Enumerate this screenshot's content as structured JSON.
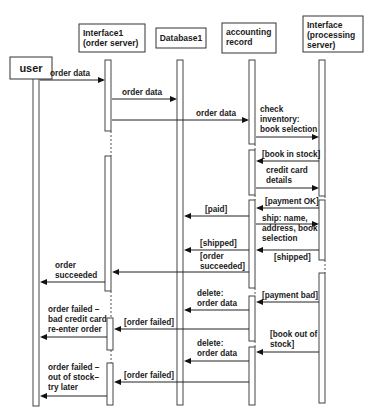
{
  "diagram": {
    "type": "sequence",
    "participants": [
      {
        "id": "user",
        "lines": [
          "user"
        ],
        "box": [
          10,
          57,
          42,
          22
        ],
        "fontSize": 11,
        "cx": 36
      },
      {
        "id": "interface1",
        "lines": [
          "Interface1",
          "(order server)"
        ],
        "box": [
          79,
          24,
          66,
          28
        ],
        "fontSize": 8.5,
        "cx": 110
      },
      {
        "id": "database1",
        "lines": [
          "Database1"
        ],
        "box": [
          156,
          28,
          50,
          20
        ],
        "fontSize": 8.5,
        "cx": 181
      },
      {
        "id": "accounting",
        "lines": [
          "accounting",
          "record"
        ],
        "box": [
          222,
          23,
          54,
          30
        ],
        "fontSize": 8.5,
        "cx": 253
      },
      {
        "id": "processing",
        "lines": [
          "Interface",
          "(processing",
          "server)"
        ],
        "box": [
          303,
          16,
          60,
          36
        ],
        "fontSize": 8.5,
        "cx": 324
      }
    ],
    "activations": [
      {
        "p": "user",
        "x": 33,
        "y1": 60,
        "y2": 406
      },
      {
        "p": "interface1",
        "x": 105,
        "y1": 60,
        "y2": 131
      },
      {
        "p": "interface1",
        "x": 105,
        "y1": 156,
        "y2": 291
      },
      {
        "p": "interface1",
        "x": 107,
        "y1": 318,
        "y2": 350
      },
      {
        "p": "interface1",
        "x": 107,
        "y1": 363,
        "y2": 405
      },
      {
        "p": "database1",
        "x": 177,
        "y1": 60,
        "y2": 405
      },
      {
        "p": "accounting",
        "x": 249,
        "y1": 60,
        "y2": 144
      },
      {
        "p": "accounting",
        "x": 249,
        "y1": 150,
        "y2": 195
      },
      {
        "p": "accounting",
        "x": 249,
        "y1": 200,
        "y2": 288
      },
      {
        "p": "accounting",
        "x": 249,
        "y1": 296,
        "y2": 341
      },
      {
        "p": "accounting",
        "x": 249,
        "y1": 347,
        "y2": 405
      },
      {
        "p": "processing",
        "x": 319,
        "y1": 60,
        "y2": 196
      },
      {
        "p": "processing",
        "x": 319,
        "y1": 200,
        "y2": 260
      },
      {
        "p": "processing",
        "x": 319,
        "y1": 273,
        "y2": 403
      }
    ],
    "lifeline_gaps": [
      {
        "x": 111,
        "y1": 131,
        "y2": 156
      },
      {
        "x": 111,
        "y1": 291,
        "y2": 318
      },
      {
        "x": 111,
        "y1": 350,
        "y2": 363
      },
      {
        "x": 255,
        "y1": 144,
        "y2": 150
      },
      {
        "x": 255,
        "y1": 195,
        "y2": 200
      },
      {
        "x": 255,
        "y1": 288,
        "y2": 296
      },
      {
        "x": 255,
        "y1": 341,
        "y2": 347
      },
      {
        "x": 325,
        "y1": 196,
        "y2": 200
      },
      {
        "x": 325,
        "y1": 260,
        "y2": 273
      }
    ],
    "messages": [
      {
        "id": "m1",
        "from": "user",
        "to": "interface1",
        "x1": 40,
        "x2": 105,
        "y": 80,
        "lines": [
          "order data"
        ],
        "tx": 50,
        "ty": 76
      },
      {
        "id": "m2",
        "from": "interface1",
        "to": "database1",
        "x1": 112,
        "x2": 177,
        "y": 99,
        "lines": [
          "order data"
        ],
        "tx": 122,
        "ty": 95
      },
      {
        "id": "m3",
        "from": "interface1",
        "to": "accounting",
        "x1": 112,
        "x2": 249,
        "y": 120,
        "lines": [
          "order data"
        ],
        "tx": 196,
        "ty": 116
      },
      {
        "id": "m4",
        "from": "accounting",
        "to": "processing",
        "x1": 256,
        "x2": 319,
        "y": 137,
        "lines": [
          "check",
          "inventory:",
          "book selection"
        ],
        "tx": 260,
        "ty": 112
      },
      {
        "id": "m5",
        "from": "processing",
        "to": "accounting",
        "x1": 319,
        "x2": 256,
        "y": 161,
        "lines": [
          "[book in stock]"
        ],
        "tx": 262,
        "ty": 157
      },
      {
        "id": "m6",
        "from": "accounting",
        "to": "processing",
        "x1": 256,
        "x2": 319,
        "y": 188,
        "lines": [
          "credit card",
          "details"
        ],
        "tx": 266,
        "ty": 173
      },
      {
        "id": "m7",
        "from": "processing",
        "to": "accounting",
        "x1": 319,
        "x2": 256,
        "y": 208,
        "lines": [
          "[payment  OK]"
        ],
        "tx": 265,
        "ty": 204
      },
      {
        "id": "m8",
        "from": "accounting",
        "to": "database1",
        "x1": 249,
        "x2": 184,
        "y": 216,
        "lines": [
          "[paid]"
        ],
        "tx": 205,
        "ty": 212
      },
      {
        "id": "m9",
        "from": "accounting",
        "to": "processing",
        "x1": 256,
        "x2": 319,
        "y": 224,
        "lines": [
          "ship: name,",
          "address, book",
          "selection"
        ],
        "tx": 262,
        "ty": 221
      },
      {
        "id": "m10",
        "from": "accounting",
        "to": "database1",
        "x1": 249,
        "x2": 184,
        "y": 250,
        "lines": [
          "[shipped]"
        ],
        "tx": 200,
        "ty": 246
      },
      {
        "id": "m11",
        "from": "processing",
        "to": "accounting",
        "x1": 319,
        "x2": 256,
        "y": 250,
        "lines": [
          "[shipped]"
        ],
        "tx": 274,
        "ty": 260
      },
      {
        "id": "m12",
        "from": "accounting",
        "to": "interface1",
        "x1": 249,
        "x2": 112,
        "y": 272,
        "lines": [
          "[order",
          "succeeded]"
        ],
        "tx": 200,
        "ty": 259
      },
      {
        "id": "m13",
        "from": "interface1",
        "to": "user",
        "x1": 105,
        "x2": 40,
        "y": 282,
        "lines": [
          "order",
          "succeeded"
        ],
        "tx": 55,
        "ty": 268
      },
      {
        "id": "m14",
        "from": "processing",
        "to": "accounting",
        "x1": 319,
        "x2": 256,
        "y": 302,
        "lines": [
          "[payment  bad]"
        ],
        "tx": 262,
        "ty": 298
      },
      {
        "id": "m15",
        "from": "accounting",
        "to": "database1",
        "x1": 249,
        "x2": 184,
        "y": 310,
        "lines": [
          "delete:",
          "order data"
        ],
        "tx": 197,
        "ty": 296
      },
      {
        "id": "m16",
        "from": "accounting",
        "to": "interface1",
        "x1": 249,
        "x2": 114,
        "y": 329,
        "lines": [
          "[order failed]"
        ],
        "tx": 124,
        "ty": 325
      },
      {
        "id": "m17",
        "from": "interface1",
        "to": "user",
        "x1": 107,
        "x2": 40,
        "y": 337,
        "lines": [
          "order failed –",
          "bad credit card",
          "re-enter order"
        ],
        "tx": 48,
        "ty": 312
      },
      {
        "id": "m18",
        "from": "processing",
        "to": "accounting",
        "x1": 319,
        "x2": 256,
        "y": 352,
        "lines": [
          "[book out of",
          "stock]"
        ],
        "tx": 270,
        "ty": 337
      },
      {
        "id": "m19",
        "from": "accounting",
        "to": "database1",
        "x1": 249,
        "x2": 184,
        "y": 361,
        "lines": [
          "delete:",
          "order data"
        ],
        "tx": 197,
        "ty": 346
      },
      {
        "id": "m20",
        "from": "accounting",
        "to": "interface1",
        "x1": 249,
        "x2": 114,
        "y": 382,
        "lines": [
          "[order failed]"
        ],
        "tx": 124,
        "ty": 378
      },
      {
        "id": "m21",
        "from": "interface1",
        "to": "user",
        "x1": 107,
        "x2": 40,
        "y": 396,
        "lines": [
          "order failed –",
          "out of stock–",
          "try later"
        ],
        "tx": 48,
        "ty": 370
      }
    ]
  }
}
